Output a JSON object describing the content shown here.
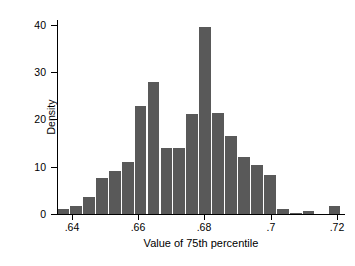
{
  "chart_data": {
    "type": "bar",
    "title": "",
    "subtitle": "",
    "xlabel": "Value of 75th percentile",
    "ylabel": "Density",
    "grid": false,
    "legend": null,
    "xlim": [
      0.6355,
      0.7215
    ],
    "ylim": [
      0,
      41
    ],
    "xticks": [
      0.64,
      0.66,
      0.68,
      0.7,
      0.72
    ],
    "xtick_labels": [
      ".64",
      ".66",
      ".68",
      ".7",
      ".72"
    ],
    "yticks": [
      0,
      10,
      20,
      30,
      40
    ],
    "ytick_labels": [
      "0",
      "10",
      "20",
      "30",
      "40"
    ],
    "bin_width": 0.0039,
    "bar_color": "#595959",
    "categories": [
      "0.6375",
      "0.6414",
      "0.6453",
      "0.6492",
      "0.6531",
      "0.6570",
      "0.6609",
      "0.6648",
      "0.6687",
      "0.6726",
      "0.6765",
      "0.6804",
      "0.6843",
      "0.6882",
      "0.6921",
      "0.6960",
      "0.6999",
      "0.7038",
      "0.7077",
      "0.7116",
      "0.7155",
      "0.7194"
    ],
    "values": [
      1.0,
      1.7,
      3.6,
      7.7,
      9.0,
      11.0,
      22.8,
      27.8,
      14.0,
      14.0,
      21.2,
      39.5,
      21.4,
      16.5,
      12.1,
      10.3,
      8.3,
      1.1,
      0.25,
      0.6,
      0.0,
      1.7
    ]
  },
  "figure": {
    "background_color": "#ffffff",
    "axis_color": "#000000"
  }
}
